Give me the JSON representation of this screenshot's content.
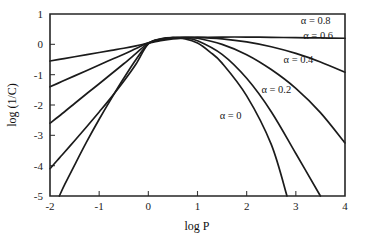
{
  "chart_data": {
    "type": "line",
    "title": "",
    "xlabel": "log P",
    "ylabel": "log (1/C)",
    "xlim": [
      -2,
      4
    ],
    "ylim": [
      -5,
      1
    ],
    "xticks": [
      -2,
      -1,
      0,
      1,
      2,
      3,
      4
    ],
    "xtick_labels": [
      "-2",
      "-1",
      "0",
      "1",
      "2",
      "3",
      "4"
    ],
    "yticks": [
      1,
      0,
      -1,
      -2,
      -3,
      -4,
      -5
    ],
    "ytick_labels": [
      "1",
      "0",
      "-1",
      "-2",
      "-3",
      "-4",
      "-5"
    ],
    "grid": false,
    "legend_position": "inline-right",
    "series": [
      {
        "name": "alpha-0.8",
        "label": "α = 0.8",
        "alpha": 0.8,
        "label_x": 3.1,
        "label_y": 0.68,
        "x": [
          -2.0,
          -1.75,
          -1.5,
          -1.25,
          -1.0,
          -0.75,
          -0.5,
          -0.25,
          0.0,
          0.25,
          0.5,
          0.75,
          1.0,
          1.5,
          2.0,
          2.5,
          3.0,
          3.5,
          4.0
        ],
        "y": [
          -0.55,
          -0.48,
          -0.41,
          -0.34,
          -0.27,
          -0.2,
          -0.13,
          -0.05,
          0.04,
          0.12,
          0.18,
          0.21,
          0.23,
          0.24,
          0.24,
          0.23,
          0.22,
          0.21,
          0.2
        ]
      },
      {
        "name": "alpha-0.6",
        "label": "α = 0.6",
        "alpha": 0.6,
        "label_x": 3.15,
        "label_y": 0.18,
        "x": [
          -2.0,
          -1.75,
          -1.5,
          -1.25,
          -1.0,
          -0.75,
          -0.5,
          -0.25,
          0.0,
          0.25,
          0.5,
          0.75,
          1.0,
          1.5,
          2.0,
          2.5,
          3.0,
          3.5,
          4.0
        ],
        "y": [
          -1.4,
          -1.22,
          -1.04,
          -0.86,
          -0.68,
          -0.5,
          -0.33,
          -0.14,
          0.05,
          0.15,
          0.21,
          0.23,
          0.23,
          0.18,
          0.08,
          -0.08,
          -0.3,
          -0.58,
          -0.92
        ]
      },
      {
        "name": "alpha-0.4",
        "label": "α = 0.4",
        "alpha": 0.4,
        "label_x": 2.75,
        "label_y": -0.6,
        "x": [
          -2.0,
          -1.75,
          -1.5,
          -1.25,
          -1.0,
          -0.75,
          -0.5,
          -0.25,
          0.0,
          0.25,
          0.5,
          0.75,
          1.0,
          1.5,
          2.0,
          2.5,
          3.0,
          3.5,
          4.0
        ],
        "y": [
          -2.6,
          -2.28,
          -1.95,
          -1.62,
          -1.3,
          -0.97,
          -0.64,
          -0.3,
          0.04,
          0.16,
          0.22,
          0.23,
          0.2,
          0.0,
          -0.34,
          -0.83,
          -1.45,
          -2.25,
          -3.25
        ]
      },
      {
        "name": "alpha-0.2",
        "label": "α = 0.2",
        "alpha": 0.2,
        "label_x": 2.3,
        "label_y": -1.6,
        "x": [
          -2.0,
          -1.85,
          -1.75,
          -1.5,
          -1.25,
          -1.0,
          -0.75,
          -0.5,
          -0.25,
          0.0,
          0.25,
          0.5,
          0.75,
          1.0,
          1.5,
          2.0,
          2.5,
          3.0,
          3.5
        ],
        "y": [
          -4.1,
          -3.82,
          -3.64,
          -3.18,
          -2.71,
          -2.23,
          -1.74,
          -1.22,
          -0.65,
          0.02,
          0.17,
          0.22,
          0.2,
          0.12,
          -0.33,
          -1.12,
          -2.22,
          -3.6,
          -5.0
        ]
      },
      {
        "name": "alpha-0",
        "label": "α = 0",
        "alpha": 0.0,
        "label_x": 1.45,
        "label_y": -2.45,
        "x": [
          -1.81,
          -1.7,
          -1.5,
          -1.25,
          -1.0,
          -0.75,
          -0.5,
          -0.25,
          0.0,
          0.25,
          0.5,
          0.75,
          1.0,
          1.25,
          1.5,
          2.0,
          2.5,
          2.82
        ],
        "y": [
          -5.0,
          -4.62,
          -3.98,
          -3.2,
          -2.47,
          -1.78,
          -1.12,
          -0.5,
          0.02,
          0.18,
          0.22,
          0.18,
          0.04,
          -0.25,
          -0.62,
          -1.7,
          -3.3,
          -5.0
        ]
      }
    ]
  },
  "axes": {
    "x_title": "log P",
    "y_title": "log (1/C)"
  }
}
